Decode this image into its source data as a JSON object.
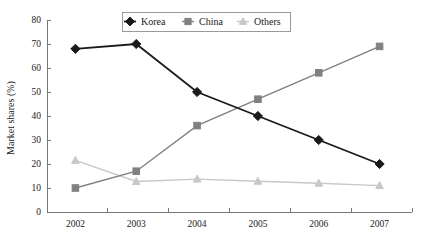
{
  "chart_data": {
    "type": "line",
    "title": "",
    "xlabel": "",
    "ylabel": "Market shares (%)",
    "categories": [
      "2002",
      "2003",
      "2004",
      "2005",
      "2006",
      "2007"
    ],
    "ylim": [
      0,
      80
    ],
    "yticks": [
      0,
      10,
      20,
      30,
      40,
      50,
      60,
      70,
      80
    ],
    "ytick_labels": [
      "0",
      "10",
      "20",
      "30",
      "40",
      "50",
      "60",
      "70",
      "80"
    ],
    "grid": false,
    "legend_position": "top-center",
    "series": [
      {
        "name": "Korea",
        "marker": "diamond",
        "color": "#1a1a1a",
        "values": [
          68,
          70,
          50,
          40,
          30,
          20
        ]
      },
      {
        "name": "China",
        "marker": "square",
        "color": "#808080",
        "values": [
          10,
          17,
          36,
          47,
          58,
          69
        ]
      },
      {
        "name": "Others",
        "marker": "triangle",
        "color": "#c8c8c8",
        "values": [
          21.5,
          12.7,
          13.7,
          12.8,
          12.0,
          11.0
        ]
      }
    ]
  },
  "legend": {
    "entries": [
      {
        "label": "Korea"
      },
      {
        "label": "China"
      },
      {
        "label": "Others"
      }
    ]
  },
  "axes": {
    "y_title": "Market shares (%)"
  }
}
